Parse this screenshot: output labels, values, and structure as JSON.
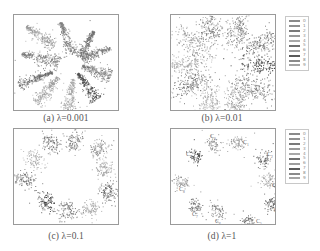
{
  "figure": {
    "panels": [
      {
        "id": "a",
        "caption": "(a) λ=0.001",
        "frame": {
          "x": 13,
          "y": 14,
          "w": 106,
          "h": 97
        },
        "caption_pos": {
          "x": 66,
          "y": 113
        },
        "has_legend": false,
        "style": "petal",
        "clusters": [
          {
            "label": "0",
            "cx": 26,
            "cy": 21,
            "angle": 35,
            "len": 34,
            "wid": 9,
            "color": "#9a9a9a",
            "core": [
              26,
              21
            ]
          },
          {
            "label": "1",
            "cx": 52,
            "cy": 23,
            "angle": 70,
            "len": 34,
            "wid": 8,
            "color": "#7e7e7e",
            "core": [
              53,
              24
            ]
          },
          {
            "label": "2",
            "cx": 72,
            "cy": 29,
            "angle": 120,
            "len": 30,
            "wid": 7,
            "color": "#707070",
            "core": [
              70,
              29
            ]
          },
          {
            "label": "3",
            "cx": 82,
            "cy": 38,
            "angle": 160,
            "len": 30,
            "wid": 7,
            "color": "#7a7a7a",
            "core": [
              86,
              38
            ]
          },
          {
            "label": "4",
            "cx": 82,
            "cy": 56,
            "angle": 20,
            "len": 30,
            "wid": 9,
            "color": "#777777",
            "core": [
              85,
              55
            ]
          },
          {
            "label": "5",
            "cx": 73,
            "cy": 71,
            "angle": 55,
            "len": 32,
            "wid": 8,
            "color": "#4a4a4a",
            "core": [
              75,
              72
            ]
          },
          {
            "label": "6",
            "cx": 56,
            "cy": 79,
            "angle": 100,
            "len": 32,
            "wid": 8,
            "color": "#a8a8a8",
            "core": [
              56,
              82
            ]
          },
          {
            "label": "7",
            "cx": 33,
            "cy": 75,
            "angle": 130,
            "len": 34,
            "wid": 9,
            "color": "#9e9e9e",
            "core": [
              34,
              76
            ]
          },
          {
            "label": "8",
            "cx": 21,
            "cy": 63,
            "angle": 160,
            "len": 36,
            "wid": 7,
            "color": "#6a6a6a",
            "core": [
              18,
              63
            ]
          },
          {
            "label": "9",
            "cx": 26,
            "cy": 43,
            "angle": 15,
            "len": 38,
            "wid": 10,
            "color": "#777777",
            "core": [
              22,
              40
            ]
          }
        ]
      },
      {
        "id": "b",
        "caption": "(b) λ=0.01",
        "frame": {
          "x": 170,
          "y": 14,
          "w": 106,
          "h": 97
        },
        "caption_pos": {
          "x": 222,
          "y": 113
        },
        "has_legend": true,
        "legend_pos": {
          "x": 285,
          "y": 16,
          "w": 24,
          "h": 55
        },
        "style": "blob",
        "clusters": [
          {
            "label": "0",
            "cx": 40,
            "cy": 12,
            "angle": 80,
            "len": 16,
            "wid": 11,
            "color": "#7a7a7a",
            "core": [
              40,
              12
            ]
          },
          {
            "label": "1",
            "cx": 66,
            "cy": 16,
            "angle": 100,
            "len": 16,
            "wid": 10,
            "color": "#7e7e7e",
            "core": [
              65,
              16
            ]
          },
          {
            "label": "2",
            "cx": 92,
            "cy": 27,
            "angle": 150,
            "len": 20,
            "wid": 10,
            "color": "#6e6e6e",
            "core": [
              92,
              27
            ]
          },
          {
            "label": "3",
            "cx": 92,
            "cy": 50,
            "angle": 0,
            "len": 24,
            "wid": 9,
            "color": "#3e3e3e",
            "core": [
              95,
              51
            ]
          },
          {
            "label": "4",
            "cx": 83,
            "cy": 72,
            "angle": 20,
            "len": 24,
            "wid": 11,
            "color": "#717171",
            "core": [
              82,
              72
            ]
          },
          {
            "label": "5",
            "cx": 65,
            "cy": 86,
            "angle": 80,
            "len": 18,
            "wid": 11,
            "color": "#8a8a8a",
            "core": [
              65,
              86
            ]
          },
          {
            "label": "6",
            "cx": 38,
            "cy": 86,
            "angle": 100,
            "len": 18,
            "wid": 11,
            "color": "#a4a4a4",
            "core": [
              38,
              87
            ]
          },
          {
            "label": "7",
            "cx": 20,
            "cy": 68,
            "angle": 150,
            "len": 22,
            "wid": 10,
            "color": "#6a6a6a",
            "core": [
              19,
              67
            ]
          },
          {
            "label": "8",
            "cx": 12,
            "cy": 49,
            "angle": 0,
            "len": 22,
            "wid": 9,
            "color": "#a0a0a0",
            "core": [
              14,
              49
            ]
          },
          {
            "label": "9",
            "cx": 23,
            "cy": 29,
            "angle": 40,
            "len": 22,
            "wid": 10,
            "color": "#8e8e8e",
            "core": [
              23,
              30
            ]
          }
        ]
      },
      {
        "id": "c",
        "caption": "(c) λ=0.1",
        "frame": {
          "x": 13,
          "y": 128,
          "w": 106,
          "h": 97
        },
        "caption_pos": {
          "x": 66,
          "y": 231
        },
        "has_legend": false,
        "style": "compact",
        "clusters": [
          {
            "label": "0",
            "cx": 36,
            "cy": 14,
            "angle": 60,
            "len": 10,
            "wid": 9,
            "color": "#6e6e6e",
            "core": [
              37,
              15
            ]
          },
          {
            "label": "1",
            "cx": 60,
            "cy": 11,
            "angle": 90,
            "len": 9,
            "wid": 8,
            "color": "#7a7a7a",
            "core": [
              60,
              11
            ]
          },
          {
            "label": "2",
            "cx": 84,
            "cy": 20,
            "angle": 130,
            "len": 10,
            "wid": 8,
            "color": "#8a8a8a",
            "core": [
              84,
              20
            ]
          },
          {
            "label": "3",
            "cx": 90,
            "cy": 40,
            "angle": 0,
            "len": 9,
            "wid": 9,
            "color": "#a0a0a0",
            "core": [
              90,
              41
            ]
          },
          {
            "label": "4",
            "cx": 94,
            "cy": 62,
            "angle": 60,
            "len": 9,
            "wid": 8,
            "color": "#5e5e5e",
            "core": [
              94,
              62
            ]
          },
          {
            "label": "5",
            "cx": 76,
            "cy": 79,
            "angle": 0,
            "len": 9,
            "wid": 8,
            "color": "#a8a8a8",
            "core": [
              76,
              79
            ]
          },
          {
            "label": "6",
            "cx": 53,
            "cy": 82,
            "angle": 45,
            "len": 10,
            "wid": 10,
            "color": "#6a6a6a",
            "core": [
              53,
              82
            ]
          },
          {
            "label": "7",
            "cx": 32,
            "cy": 72,
            "angle": 60,
            "len": 10,
            "wid": 8,
            "color": "#3a3a3a",
            "core": [
              32,
              71
            ]
          },
          {
            "label": "8",
            "cx": 10,
            "cy": 50,
            "angle": 0,
            "len": 11,
            "wid": 7,
            "color": "#6a6a6a",
            "core": [
              11,
              50
            ]
          },
          {
            "label": "9",
            "cx": 19,
            "cy": 30,
            "angle": 20,
            "len": 10,
            "wid": 9,
            "color": "#aaaaaa",
            "core": [
              20,
              30
            ]
          }
        ]
      },
      {
        "id": "d",
        "caption": "(d) λ=1",
        "frame": {
          "x": 170,
          "y": 128,
          "w": 106,
          "h": 97
        },
        "caption_pos": {
          "x": 222,
          "y": 231
        },
        "has_legend": true,
        "legend_pos": {
          "x": 285,
          "y": 129,
          "w": 24,
          "h": 55
        },
        "style": "tight",
        "clusters": [
          {
            "label": "C",
            "cx": 42,
            "cy": 15,
            "angle": 0,
            "len": 7,
            "wid": 7,
            "color": "#888888",
            "core": [
              42,
              15
            ],
            "tag": "C",
            "tag_dx": -3,
            "tag_dy": -6
          },
          {
            "label": "C",
            "cx": 66,
            "cy": 13,
            "angle": 0,
            "len": 7,
            "wid": 7,
            "color": "#8a8a8a",
            "core": [
              66,
              13
            ],
            "tag": "C",
            "tag_dx": 6,
            "tag_dy": 2
          },
          {
            "label": "C",
            "cx": 92,
            "cy": 30,
            "angle": 0,
            "len": 7,
            "wid": 7,
            "color": "#5e5e5e",
            "core": [
              92,
              30
            ],
            "tag": "C",
            "tag_dx": 4,
            "tag_dy": -3
          },
          {
            "label": "C",
            "cx": 97,
            "cy": 50,
            "angle": 0,
            "len": 7,
            "wid": 7,
            "color": "#999999",
            "core": [
              97,
              50
            ],
            "tag": "C",
            "tag_dx": 4,
            "tag_dy": 8
          },
          {
            "label": "C",
            "cx": 100,
            "cy": 75,
            "angle": 0,
            "len": 6,
            "wid": 6,
            "color": "#555555",
            "core": [
              100,
              75
            ],
            "tag": "C",
            "tag_dx": 3,
            "tag_dy": 8
          },
          {
            "label": "C",
            "cx": 77,
            "cy": 93,
            "angle": 0,
            "len": 6,
            "wid": 6,
            "color": "#5a5a5a",
            "core": [
              77,
              93
            ],
            "tag": "C",
            "tag_dx": 8,
            "tag_dy": 1
          },
          {
            "label": "C",
            "cx": 46,
            "cy": 82,
            "angle": 60,
            "len": 9,
            "wid": 7,
            "color": "#777777",
            "core": [
              46,
              82
            ],
            "tag": "C",
            "tag_dx": -2,
            "tag_dy": 12
          },
          {
            "label": "C",
            "cx": 23,
            "cy": 77,
            "angle": 0,
            "len": 7,
            "wid": 7,
            "color": "#666666",
            "core": [
              23,
              77
            ],
            "tag": "C",
            "tag_dx": -2,
            "tag_dy": 10
          },
          {
            "label": "C",
            "cx": 9,
            "cy": 52,
            "angle": 0,
            "len": 7,
            "wid": 7,
            "color": "#8e8e8e",
            "core": [
              10,
              52
            ],
            "tag": "C",
            "tag_dx": -1,
            "tag_dy": 10
          },
          {
            "label": "C",
            "cx": 25,
            "cy": 27,
            "angle": 0,
            "len": 6,
            "wid": 6,
            "color": "#3a3a3a",
            "core": [
              25,
              27
            ],
            "tag": "C",
            "tag_dx": -10,
            "tag_dy": 0
          }
        ]
      }
    ],
    "legend": {
      "entries": [
        {
          "label": "0",
          "color": "#8a8a8a"
        },
        {
          "label": "1",
          "color": "#909090"
        },
        {
          "label": "2",
          "color": "#7a7a7a"
        },
        {
          "label": "3",
          "color": "#9a9a9a"
        },
        {
          "label": "4",
          "color": "#a8a8a8"
        },
        {
          "label": "5",
          "color": "#707070"
        },
        {
          "label": "6",
          "color": "#9e9e9e"
        },
        {
          "label": "7",
          "color": "#5a5a5a"
        },
        {
          "label": "8",
          "color": "#8a8a8a"
        },
        {
          "label": "9",
          "color": "#a4a4a4"
        }
      ]
    }
  },
  "chart_data": [
    {
      "type": "scatter",
      "title": "(a) λ=0.001",
      "xlabel": "",
      "ylabel": "",
      "grid": false,
      "legend_position": "none",
      "series": [
        {
          "name": "0"
        },
        {
          "name": "1"
        },
        {
          "name": "2"
        },
        {
          "name": "3"
        },
        {
          "name": "4"
        },
        {
          "name": "5"
        },
        {
          "name": "6"
        },
        {
          "name": "7"
        },
        {
          "name": "8"
        },
        {
          "name": "9"
        }
      ],
      "annotations": [
        "10 elongated radial petal-shaped clusters with white centroid dots"
      ]
    },
    {
      "type": "scatter",
      "title": "(b) λ=0.01",
      "xlabel": "",
      "ylabel": "",
      "grid": false,
      "legend_position": "right",
      "legend": [
        "0",
        "1",
        "2",
        "3",
        "4",
        "5",
        "6",
        "7",
        "8",
        "9"
      ],
      "series": [
        {
          "name": "0"
        },
        {
          "name": "1"
        },
        {
          "name": "2"
        },
        {
          "name": "3"
        },
        {
          "name": "4"
        },
        {
          "name": "5"
        },
        {
          "name": "6"
        },
        {
          "name": "7"
        },
        {
          "name": "8"
        },
        {
          "name": "9"
        }
      ],
      "annotations": [
        "10 oval clusters arranged in a ring with white centroid dots"
      ]
    },
    {
      "type": "scatter",
      "title": "(c) λ=0.1",
      "xlabel": "",
      "ylabel": "",
      "grid": false,
      "legend_position": "none",
      "series": [
        {
          "name": "0"
        },
        {
          "name": "1"
        },
        {
          "name": "2"
        },
        {
          "name": "3"
        },
        {
          "name": "4"
        },
        {
          "name": "5"
        },
        {
          "name": "6"
        },
        {
          "name": "7"
        },
        {
          "name": "8"
        },
        {
          "name": "9"
        }
      ],
      "annotations": [
        "10 compact clusters arranged in a ring with white centroid dots"
      ]
    },
    {
      "type": "scatter",
      "title": "(d) λ=1",
      "xlabel": "",
      "ylabel": "",
      "grid": false,
      "legend_position": "right",
      "legend": [
        "0",
        "1",
        "2",
        "3",
        "4",
        "5",
        "6",
        "7",
        "8",
        "9"
      ],
      "series": [
        {
          "name": "0"
        },
        {
          "name": "1"
        },
        {
          "name": "2"
        },
        {
          "name": "3"
        },
        {
          "name": "4"
        },
        {
          "name": "5"
        },
        {
          "name": "6"
        },
        {
          "name": "7"
        },
        {
          "name": "8"
        },
        {
          "name": "9"
        }
      ],
      "annotations": [
        "10 very tight clusters in a ring, each annotated with a class label C_i"
      ]
    }
  ]
}
